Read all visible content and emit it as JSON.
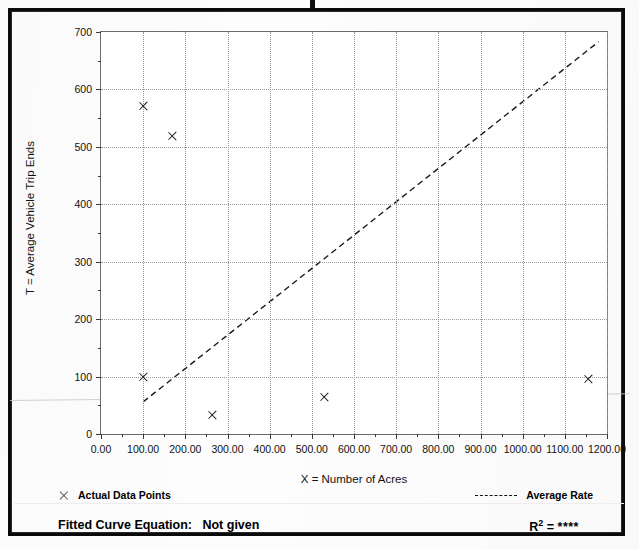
{
  "chart_data": {
    "type": "scatter",
    "title": "",
    "xlabel": "X = Number of Acres",
    "ylabel": "T = Average Vehicle Trip Ends",
    "xlim": [
      0,
      1200
    ],
    "ylim": [
      0,
      700
    ],
    "xticks": [
      "0.00",
      "100.00",
      "200.00",
      "300.00",
      "400.00",
      "500.00",
      "600.00",
      "700.00",
      "800.00",
      "900.00",
      "1000.00",
      "1100.00",
      "1200.00"
    ],
    "xtick_values": [
      0,
      100,
      200,
      300,
      400,
      500,
      600,
      700,
      800,
      900,
      1000,
      1100,
      1200
    ],
    "yticks": [
      "0",
      "100",
      "200",
      "300",
      "400",
      "500",
      "600",
      "700"
    ],
    "ytick_values": [
      0,
      100,
      200,
      300,
      400,
      500,
      600,
      700
    ],
    "y_minor_step": 50,
    "x_minor_step": 50,
    "grid": true,
    "legend_position": "below-axes",
    "series": [
      {
        "name": "Actual Data Points",
        "type": "scatter",
        "marker": "x",
        "points": [
          {
            "x": 100,
            "y": 571
          },
          {
            "x": 170,
            "y": 519
          },
          {
            "x": 100,
            "y": 100
          },
          {
            "x": 265,
            "y": 33
          },
          {
            "x": 530,
            "y": 65
          },
          {
            "x": 1155,
            "y": 95
          }
        ]
      },
      {
        "name": "Average Rate",
        "type": "line",
        "style": "dashed",
        "endpoints": [
          {
            "x": 100,
            "y": 56
          },
          {
            "x": 1180,
            "y": 683
          }
        ]
      }
    ]
  },
  "legend": {
    "actual_points_label": "Actual Data Points",
    "average_rate_label": "Average Rate",
    "marker_icon": "x-marker-icon",
    "line_icon": "dashed-line-icon"
  },
  "footer": {
    "equation_label": "Fitted Curve Equation:",
    "equation_value": "Not given",
    "r2_label": "R",
    "r2_exponent": "2",
    "r2_equals": "=",
    "r2_value": "****"
  }
}
